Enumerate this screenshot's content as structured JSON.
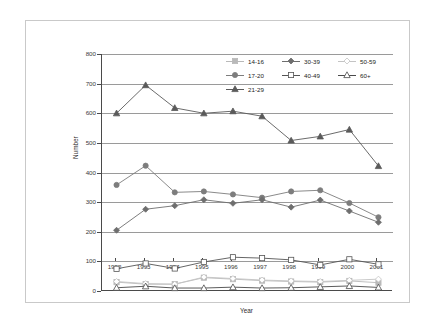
{
  "chart_data": {
    "type": "line",
    "title": "",
    "xlabel": "Year",
    "ylabel": "Number",
    "categories": [
      "1992",
      "1993",
      "1994",
      "1995",
      "1996",
      "1997",
      "1998",
      "1999",
      "2000",
      "2001"
    ],
    "ylim": [
      0,
      800
    ],
    "ytick_step": 100,
    "yticks": [
      "0",
      "100",
      "200",
      "300",
      "400",
      "500",
      "600",
      "700",
      "800"
    ],
    "grid": true,
    "legend_position": "top-right-inside",
    "series": [
      {
        "name": "14-16",
        "marker": "filled-square",
        "color": "#b9b9b9",
        "values": [
          30,
          23,
          23,
          45,
          40,
          35,
          32,
          30,
          34,
          28
        ]
      },
      {
        "name": "17-20",
        "marker": "filled-circle",
        "color": "#7d7d7d",
        "values": [
          358,
          423,
          333,
          336,
          326,
          315,
          336,
          340,
          297,
          249
        ]
      },
      {
        "name": "21-29",
        "marker": "filled-triangle",
        "color": "#5a5a5a",
        "values": [
          600,
          695,
          618,
          600,
          607,
          590,
          508,
          522,
          545,
          422
        ]
      },
      {
        "name": "30-39",
        "marker": "filled-diamond",
        "color": "#6e6e6e",
        "values": [
          205,
          276,
          288,
          308,
          296,
          308,
          283,
          307,
          270,
          232
        ]
      },
      {
        "name": "40-49",
        "marker": "open-square",
        "color": "#555555",
        "values": [
          75,
          93,
          76,
          98,
          114,
          111,
          105,
          88,
          107,
          90
        ]
      },
      {
        "name": "50-59",
        "marker": "open-diamond",
        "color": "#c4c4c4",
        "values": [
          32,
          25,
          23,
          47,
          42,
          37,
          34,
          32,
          36,
          40
        ]
      },
      {
        "name": "60+",
        "marker": "open-triangle",
        "color": "#4a4a4a",
        "values": [
          11,
          16,
          10,
          10,
          13,
          10,
          11,
          14,
          17,
          12
        ]
      }
    ]
  },
  "legend": {
    "rows": [
      [
        {
          "label": "14-16"
        },
        {
          "label": "30-39"
        },
        {
          "label": "50-59"
        }
      ],
      [
        {
          "label": "17-20"
        },
        {
          "label": "40-49"
        },
        {
          "label": "60+"
        }
      ],
      [
        {
          "label": "21-29"
        }
      ]
    ]
  }
}
